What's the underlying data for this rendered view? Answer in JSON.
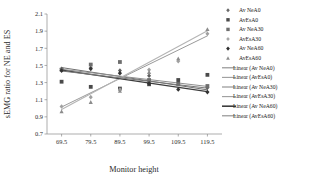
{
  "chart_data": {
    "type": "scatter",
    "title": "",
    "xlabel": "Monitor height",
    "ylabel": "sEMG ratio for NE and ES",
    "xlim": [
      64.5,
      124.5
    ],
    "ylim": [
      0.7,
      2.1
    ],
    "xticks": [
      "69.5",
      "79.5",
      "89.5",
      "99.5",
      "109.5",
      "119.5"
    ],
    "yticks": [
      "0.7",
      "0.9",
      "1.1",
      "1.3",
      "1.5",
      "1.7",
      "1.9",
      "2.1"
    ],
    "grid": false,
    "legend_position": "right",
    "series": [
      {
        "name": "Av NeA0",
        "marker": "diamond",
        "color": "#5f5f5f",
        "points": [
          {
            "x": 69.5,
            "y": 1.46
          },
          {
            "x": 79.5,
            "y": 1.47
          },
          {
            "x": 89.5,
            "y": 1.44
          },
          {
            "x": 99.5,
            "y": 1.38
          },
          {
            "x": 109.5,
            "y": 1.3
          },
          {
            "x": 119.5,
            "y": 1.24
          }
        ]
      },
      {
        "name": "AvEsA0",
        "marker": "square",
        "color": "#4a4a4a",
        "points": [
          {
            "x": 69.5,
            "y": 1.31
          },
          {
            "x": 79.5,
            "y": 1.25
          },
          {
            "x": 89.5,
            "y": 1.23
          },
          {
            "x": 99.5,
            "y": 1.28
          },
          {
            "x": 109.5,
            "y": 1.33
          },
          {
            "x": 119.5,
            "y": 1.39
          }
        ]
      },
      {
        "name": "Av NeA30",
        "marker": "square",
        "color": "#6e6e6e",
        "points": [
          {
            "x": 69.5,
            "y": 1.45
          },
          {
            "x": 79.5,
            "y": 1.51
          },
          {
            "x": 89.5,
            "y": 1.54
          },
          {
            "x": 99.5,
            "y": 1.33
          },
          {
            "x": 109.5,
            "y": 1.28
          },
          {
            "x": 119.5,
            "y": 1.26
          }
        ]
      },
      {
        "name": "AvEsA30",
        "marker": "diamond",
        "color": "#a0a0a0",
        "points": [
          {
            "x": 69.5,
            "y": 1.02
          },
          {
            "x": 79.5,
            "y": 1.13
          },
          {
            "x": 89.5,
            "y": 1.22
          },
          {
            "x": 99.5,
            "y": 1.45
          },
          {
            "x": 109.5,
            "y": 1.55
          },
          {
            "x": 119.5,
            "y": 1.87
          }
        ]
      },
      {
        "name": "Av NeA60",
        "marker": "diamond-solid",
        "color": "#333333",
        "points": [
          {
            "x": 69.5,
            "y": 1.44
          },
          {
            "x": 79.5,
            "y": 1.46
          },
          {
            "x": 89.5,
            "y": 1.41
          },
          {
            "x": 99.5,
            "y": 1.29
          },
          {
            "x": 109.5,
            "y": 1.22
          },
          {
            "x": 119.5,
            "y": 1.19
          }
        ]
      },
      {
        "name": "AvEsA60",
        "marker": "triangle",
        "color": "#8c8c8c",
        "points": [
          {
            "x": 69.5,
            "y": 0.96
          },
          {
            "x": 79.5,
            "y": 1.07
          },
          {
            "x": 89.5,
            "y": 1.2
          },
          {
            "x": 99.5,
            "y": 1.42
          },
          {
            "x": 109.5,
            "y": 1.58
          },
          {
            "x": 119.5,
            "y": 1.92
          }
        ]
      }
    ],
    "trendlines": [
      {
        "name": "Linear (Av NeA0)",
        "color": "#707070",
        "width": 1.0,
        "x0": 69.5,
        "y0": 1.475,
        "x1": 119.5,
        "y1": 1.215
      },
      {
        "name": "Linear (AvEsA0)",
        "color": "#8f8f8f",
        "width": 1.0,
        "x0": 69.5,
        "y0": 1.455,
        "x1": 119.5,
        "y1": 1.255
      },
      {
        "name": "Linear (Av NeA30)",
        "color": "#9a9a9a",
        "width": 1.0,
        "x0": 69.5,
        "y0": 1.015,
        "x1": 119.5,
        "y1": 1.845
      },
      {
        "name": "Linear (AvEsA30)",
        "color": "#b4b4b4",
        "width": 1.1,
        "x0": 69.5,
        "y0": 0.985,
        "x1": 119.5,
        "y1": 1.905
      },
      {
        "name": "Linear (Av NeA60)",
        "color": "#3d3d3d",
        "width": 1.3,
        "x0": 69.5,
        "y0": 1.445,
        "x1": 119.5,
        "y1": 1.195
      },
      {
        "name": "Linear (AvEsA60)",
        "color": "#777777",
        "width": 1.0,
        "x0": 69.5,
        "y0": 1.435,
        "x1": 119.5,
        "y1": 1.235
      }
    ],
    "legend_markers": [
      {
        "label": "Av NeA0",
        "marker": "diamond",
        "color": "#6a6a6a"
      },
      {
        "label": "AvEsA0",
        "marker": "square",
        "color": "#4a4a4a"
      },
      {
        "label": "Av NeA30",
        "marker": "square",
        "color": "#6e6e6e"
      },
      {
        "label": "AvEsA30",
        "marker": "diamond",
        "color": "#a8a8a8"
      },
      {
        "label": "Av NeA60",
        "marker": "diamond-solid",
        "color": "#2e2e2e"
      },
      {
        "label": "AvEsA60",
        "marker": "triangle",
        "color": "#8c8c8c"
      }
    ],
    "legend_lines": [
      {
        "label": "Linear (Av NeA0)",
        "color": "#8a8a8a",
        "width": 1.1
      },
      {
        "label": "Linear (AvEsA0)",
        "color": "#9c9c9c",
        "width": 1.1
      },
      {
        "label": "Linear (Av NeA30)",
        "color": "#8a8a8a",
        "width": 1.1
      },
      {
        "label": "Linear (AvEsA30)",
        "color": "#9c9c9c",
        "width": 1.1
      },
      {
        "label": "Linear (Av NeA60)",
        "color": "#3d3d3d",
        "width": 1.6
      },
      {
        "label": "Linear (AvEsA60)",
        "color": "#8a8a8a",
        "width": 1.1
      }
    ]
  }
}
